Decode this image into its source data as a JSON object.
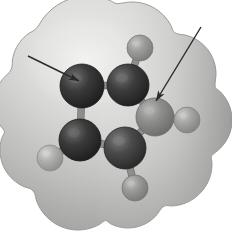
{
  "figure": {
    "type": "molecular-model",
    "canvas": {
      "width": 232,
      "height": 237
    },
    "background_color": "#ffffff"
  },
  "envelope": {
    "label": "van der Waals surface envelope",
    "fill_light": "#d8d8d6",
    "fill_mid": "#c2c2c0",
    "fill_dark": "#a9a9a7",
    "outline_color": "#9a9a98",
    "highlight_color": "#e8e8e6"
  },
  "atoms": [
    {
      "id": "C1",
      "element": "C",
      "label": "carbon-upper-left",
      "cx": 82,
      "cy": 86,
      "r": 22,
      "color": "#3a3a3a",
      "highlight": "#6e6e6e",
      "shadow": "#1b1b1b"
    },
    {
      "id": "C2",
      "element": "C",
      "label": "carbon-upper-middle",
      "cx": 128,
      "cy": 85,
      "r": 21,
      "color": "#3d3d3d",
      "highlight": "#717171",
      "shadow": "#1d1d1d"
    },
    {
      "id": "C3",
      "element": "C",
      "label": "carbon-lower-left",
      "cx": 80,
      "cy": 140,
      "r": 21,
      "color": "#3a3a3a",
      "highlight": "#6e6e6e",
      "shadow": "#1b1b1b"
    },
    {
      "id": "C4",
      "element": "C",
      "label": "carbon-lower-middle",
      "cx": 125,
      "cy": 148,
      "r": 21,
      "color": "#4a4a4a",
      "highlight": "#7d7d7d",
      "shadow": "#262626"
    },
    {
      "id": "X1",
      "element": "X",
      "label": "highlighted-atom-right",
      "cx": 155,
      "cy": 117,
      "r": 19,
      "color": "#8e8e8c",
      "highlight": "#b8b8b6",
      "shadow": "#6a6a68"
    },
    {
      "id": "H1",
      "element": "H",
      "label": "hydrogen-top",
      "cx": 140,
      "cy": 48,
      "r": 13,
      "color": "#9d9d9b",
      "highlight": "#c6c6c4",
      "shadow": "#797977"
    },
    {
      "id": "H2",
      "element": "H",
      "label": "hydrogen-right",
      "cx": 187,
      "cy": 120,
      "r": 13,
      "color": "#a5a5a3",
      "highlight": "#cdcdcb",
      "shadow": "#818180"
    },
    {
      "id": "H3",
      "element": "H",
      "label": "hydrogen-lower-left",
      "cx": 50,
      "cy": 158,
      "r": 13,
      "color": "#b0b0ae",
      "highlight": "#d6d6d4",
      "shadow": "#8b8b89"
    },
    {
      "id": "H4",
      "element": "H",
      "label": "hydrogen-bottom",
      "cx": 135,
      "cy": 188,
      "r": 13,
      "color": "#9a9a98",
      "highlight": "#c3c3c1",
      "shadow": "#767674"
    }
  ],
  "bonds": [
    {
      "from": "C1",
      "to": "C2",
      "label": "bond-c1-c2"
    },
    {
      "from": "C1",
      "to": "C3",
      "label": "bond-c1-c3"
    },
    {
      "from": "C2",
      "to": "X1",
      "label": "bond-c2-x1"
    },
    {
      "from": "C2",
      "to": "H1",
      "label": "bond-c2-h1"
    },
    {
      "from": "C3",
      "to": "C4",
      "label": "bond-c3-c4"
    },
    {
      "from": "C3",
      "to": "H3",
      "label": "bond-c3-h3"
    },
    {
      "from": "C4",
      "to": "X1",
      "label": "bond-c4-x1"
    },
    {
      "from": "C4",
      "to": "H4",
      "label": "bond-c4-h4"
    },
    {
      "from": "X1",
      "to": "H2",
      "label": "bond-x1-h2"
    }
  ],
  "bond_style": {
    "color": "#8d8d8b",
    "edge_color": "#6f6f6d",
    "width": 6
  },
  "annotations": [
    {
      "id": "arrow-left",
      "label": "annotation-arrow-left",
      "target_atom": "C1",
      "x1": 28,
      "y1": 56,
      "x2": 79,
      "y2": 81,
      "color": "#2a2a2a",
      "width": 1.4
    },
    {
      "id": "arrow-right",
      "label": "annotation-arrow-right",
      "target_atom": "X1",
      "x1": 201,
      "y1": 27,
      "x2": 156,
      "y2": 101,
      "color": "#2a2a2a",
      "width": 1.4
    }
  ]
}
